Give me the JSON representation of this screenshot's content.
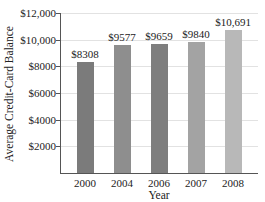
{
  "chart_data": {
    "type": "bar",
    "title": "",
    "xlabel": "Year",
    "ylabel": "Average Credit-Card Balance",
    "categories": [
      "2000",
      "2004",
      "2006",
      "2007",
      "2008"
    ],
    "values": [
      8308,
      9577,
      9659,
      9840,
      10691
    ],
    "value_labels": [
      "$8308",
      "$9577",
      "$9659",
      "$9840",
      "$10,691"
    ],
    "ylim": [
      0,
      12000
    ],
    "yticks": [
      2000,
      4000,
      6000,
      8000,
      10000,
      12000
    ],
    "ytick_labels": [
      "$2000",
      "$4000",
      "$6000",
      "$8000",
      "$10,000",
      "$12,000"
    ],
    "grid": true,
    "legend": null,
    "bar_colors": [
      "#7b7b7b",
      "#8e8e8e",
      "#7e7e7e",
      "#a3a3a3",
      "#b8b8b8"
    ]
  }
}
